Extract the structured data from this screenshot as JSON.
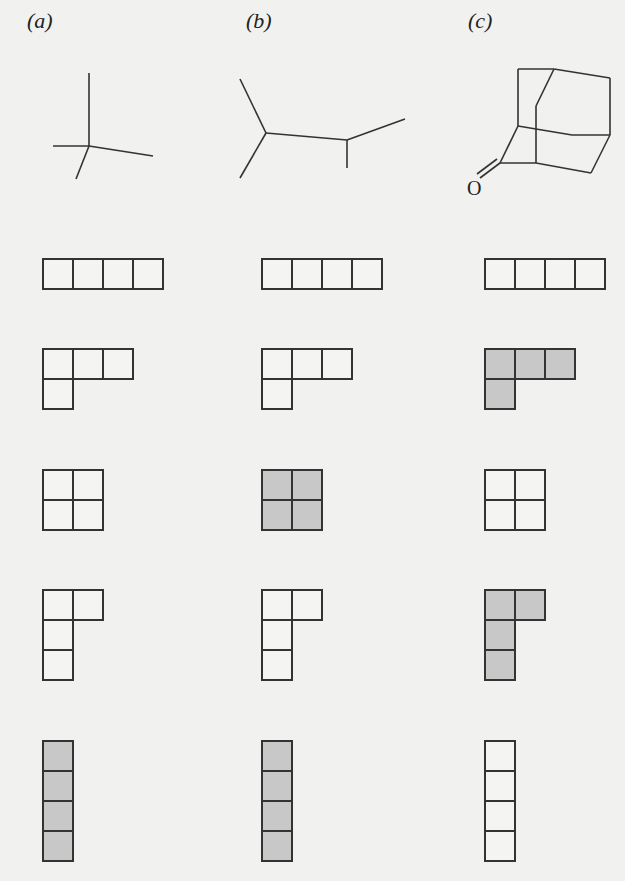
{
  "figure": {
    "panels": [
      {
        "id": "a",
        "label": "(a)",
        "label_x": 27,
        "molecule": "neopentane-like skeleton"
      },
      {
        "id": "b",
        "label": "(b)",
        "label_x": 246,
        "molecule": "2,3-dimethylbutane-like skeleton"
      },
      {
        "id": "c",
        "label": "(c)",
        "label_x": 468,
        "molecule": "adamantanone-like cage",
        "atom_label": "O"
      }
    ],
    "cell_size": 30,
    "colors": {
      "shaded": "#c8c8c8",
      "unshaded": "#f4f4f2",
      "stroke": "#333333",
      "background": "#f1f1ef"
    },
    "columns_x": [
      43,
      262,
      485
    ],
    "rows": [
      {
        "name": "row-1-horizontal-tetromino",
        "y": 259,
        "cells": [
          [
            0,
            0
          ],
          [
            1,
            0
          ],
          [
            2,
            0
          ],
          [
            3,
            0
          ]
        ],
        "shaded": [
          false,
          false,
          false
        ]
      },
      {
        "name": "row-2-L-tetromino",
        "y": 349,
        "cells": [
          [
            0,
            0
          ],
          [
            1,
            0
          ],
          [
            2,
            0
          ],
          [
            0,
            1
          ]
        ],
        "shaded": [
          false,
          false,
          true
        ]
      },
      {
        "name": "row-3-square-tetromino",
        "y": 470,
        "cells": [
          [
            0,
            0
          ],
          [
            1,
            0
          ],
          [
            0,
            1
          ],
          [
            1,
            1
          ]
        ],
        "shaded": [
          false,
          true,
          false
        ]
      },
      {
        "name": "row-4-vertical-L-tetromino",
        "y": 590,
        "cells": [
          [
            0,
            0
          ],
          [
            1,
            0
          ],
          [
            0,
            1
          ],
          [
            0,
            2
          ]
        ],
        "shaded": [
          false,
          false,
          true
        ]
      },
      {
        "name": "row-5-vertical-tetromino",
        "y": 741,
        "cells": [
          [
            0,
            0
          ],
          [
            0,
            1
          ],
          [
            0,
            2
          ],
          [
            0,
            3
          ]
        ],
        "shaded": [
          true,
          true,
          false
        ]
      }
    ]
  }
}
